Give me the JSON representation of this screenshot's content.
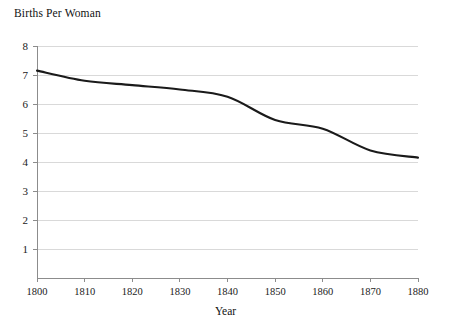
{
  "chart_data": {
    "type": "line",
    "title": "Births Per Woman",
    "xlabel": "Year",
    "ylabel": "",
    "x": [
      1800,
      1810,
      1820,
      1830,
      1840,
      1850,
      1860,
      1870,
      1880
    ],
    "values": [
      7.15,
      6.8,
      6.65,
      6.5,
      6.25,
      5.45,
      5.15,
      4.4,
      4.15
    ],
    "series": [
      {
        "name": "Births Per Woman",
        "values": [
          7.15,
          6.8,
          6.65,
          6.5,
          6.25,
          5.45,
          5.15,
          4.4,
          4.15
        ]
      }
    ],
    "xlim": [
      1800,
      1880
    ],
    "ylim": [
      0,
      8
    ],
    "xticks": [
      1800,
      1810,
      1820,
      1830,
      1840,
      1850,
      1860,
      1870,
      1880
    ],
    "xtick_labels": [
      "1800",
      "1810",
      "1820",
      "1830",
      "1840",
      "1850",
      "1860",
      "1870",
      "1880"
    ],
    "yticks": [
      1,
      2,
      3,
      4,
      5,
      6,
      7,
      8
    ],
    "ytick_labels": [
      "1",
      "2",
      "3",
      "4",
      "5",
      "6",
      "7",
      "8"
    ],
    "grid": "horizontal",
    "legend": "none",
    "line_color": "#1a1a1a",
    "grid_color": "#d9d9d9",
    "axis_color": "#8c8c8c",
    "background": "#ffffff"
  }
}
